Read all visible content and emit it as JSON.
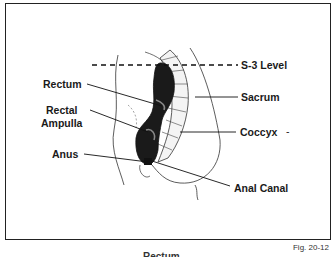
{
  "figure": {
    "number": "Fig. 20-12",
    "caption": "Rectum",
    "labels": {
      "s3_level": "S-3 Level",
      "rectum": "Rectum",
      "sacrum": "Sacrum",
      "rectal_ampulla_line1": "Rectal",
      "rectal_ampulla_line2": "Ampulla",
      "coccyx": "Coccyx",
      "coccyx_mark": "-",
      "anus": "Anus",
      "anal_canal": "Anal Canal"
    }
  }
}
